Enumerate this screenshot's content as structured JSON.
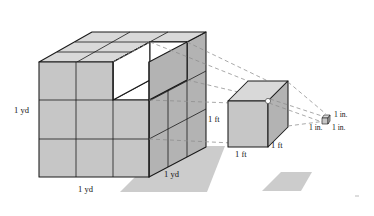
{
  "figure": {
    "background": "#ffffff",
    "palette": {
      "face_top": "#d9d9d9",
      "face_front": "#c6c6c6",
      "face_right": "#b3b3b3",
      "face_hidden_white": "#ffffff",
      "outline": "#1a1a1a",
      "dashed_guide": "#8c8c8c",
      "shadow": "#cccccc"
    },
    "objects": [
      {
        "name": "cubic-yard-block",
        "description": "3 by 3 by 3 stack of foot cubes with one cube removed at the front top right",
        "divisions": 3,
        "removed_cubes": 1,
        "labels": [
          {
            "text": "1 yd",
            "position": "left-height"
          },
          {
            "text": "1 yd",
            "position": "bottom-front-width"
          },
          {
            "text": "1 yd",
            "position": "bottom-right-depth"
          }
        ]
      },
      {
        "name": "cubic-foot-cube",
        "description": "single cube extracted from the yard block",
        "labels": [
          {
            "text": "1 ft",
            "position": "left-height"
          },
          {
            "text": "1 ft",
            "position": "bottom-front-width"
          },
          {
            "text": "1 ft",
            "position": "bottom-right-depth"
          }
        ]
      },
      {
        "name": "cubic-inch-cube",
        "description": "tiny cube extracted from the foot cube",
        "labels": [
          {
            "text": "1 in.",
            "position": "right-top"
          },
          {
            "text": "1 in.",
            "position": "bottom-left"
          },
          {
            "text": "1 in.",
            "position": "bottom-right"
          }
        ]
      }
    ],
    "labels": {
      "yd_height": "1 yd",
      "yd_width": "1 yd",
      "yd_depth": "1 yd",
      "ft_height": "1 ft",
      "ft_width": "1 ft",
      "ft_depth": "1 ft",
      "in_top": "1 in.",
      "in_left": "1 in.",
      "in_right": "1 in."
    }
  }
}
